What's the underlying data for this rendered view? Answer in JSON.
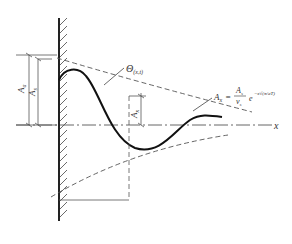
{
  "diagram": {
    "axis_label": "x",
    "theta_label": "Θ",
    "theta_sub": "(x,t)",
    "label_Aa": "A",
    "label_Aa_sub": "a",
    "label_As": "A",
    "label_As_sub": "s",
    "label_Ax": "A",
    "label_Ax_sub": "x",
    "formula": {
      "lhs": "A",
      "lhs_sub": "x",
      "eq": "=",
      "num": "A",
      "num_sub": "s",
      "den": "v",
      "den_sub": "s",
      "exp": "e",
      "exp_power": "−x√(π/aT)"
    },
    "colors": {
      "line": "#222222",
      "dash": "#555555"
    }
  }
}
